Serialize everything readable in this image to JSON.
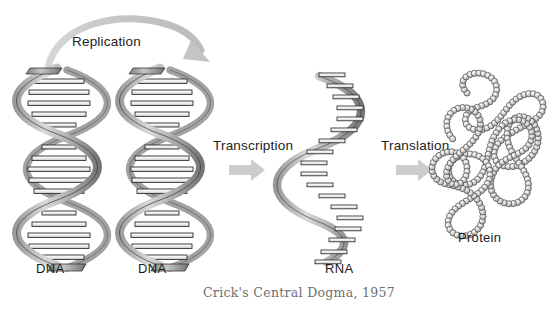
{
  "diagram": {
    "title": "Crick's Central Dogma, 1957",
    "caption": "Crick's Central Dogma, 1957",
    "background_color": "#ffffff",
    "text_color": "#1b1b1b",
    "caption_color": "#6e6e6e",
    "arrow_color": "#c9c9c9",
    "molecule_stroke": "#333333",
    "molecule_fill_light": "#e8e8e8",
    "molecule_fill_dark": "#8a8a8a"
  },
  "structures": [
    {
      "id": "dna-template",
      "label": "DNA",
      "kind": "double-helix"
    },
    {
      "id": "dna-copy",
      "label": "DNA",
      "kind": "double-helix"
    },
    {
      "id": "rna",
      "label": "RNA",
      "kind": "single-helix"
    },
    {
      "id": "protein",
      "label": "Protein",
      "kind": "bead-chain"
    }
  ],
  "processes": [
    {
      "id": "replication",
      "label": "Replication",
      "arrow": "curved-arc-arrow",
      "from": "DNA",
      "to": "DNA"
    },
    {
      "id": "transcription",
      "label": "Transcription",
      "arrow": "block-arrow-right",
      "from": "DNA",
      "to": "RNA"
    },
    {
      "id": "translation",
      "label": "Translation",
      "arrow": "block-arrow-right",
      "from": "RNA",
      "to": "Protein"
    }
  ],
  "labels": {
    "dna_1": "DNA",
    "dna_2": "DNA",
    "rna": "RNA",
    "protein": "Protein",
    "replication": "Replication",
    "transcription": "Transcription",
    "translation": "Translation"
  }
}
